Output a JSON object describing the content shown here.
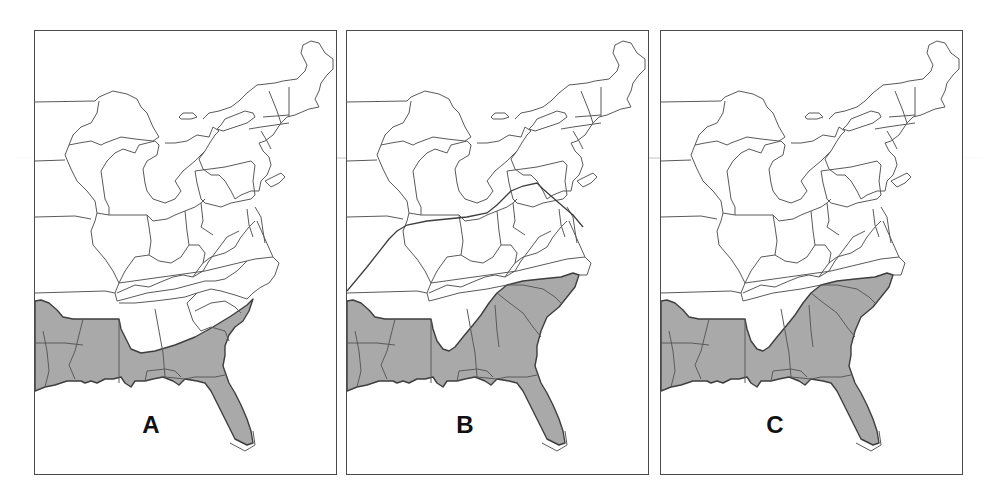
{
  "figure": {
    "shade_color": "#a9a9a9",
    "border_color": "#4a4a4a",
    "panels": [
      {
        "label": "A",
        "shaded_states": [
          "Texas (east part)",
          "Louisiana",
          "Arkansas (south)",
          "Mississippi",
          "Alabama (south)",
          "Georgia",
          "South Carolina",
          "Florida (except tip)"
        ],
        "has_outline_polygon": false
      },
      {
        "label": "B",
        "shaded_states": [
          "Texas (east part)",
          "Louisiana",
          "Arkansas (south)",
          "Mississippi",
          "Alabama (except wedge)",
          "Georgia",
          "South Carolina",
          "North Carolina (south)",
          "Florida (except tip)"
        ],
        "has_outline_polygon": true,
        "outline_polygon_note": "Outlined region covering Tennessee, Kentucky, and Virginia area"
      },
      {
        "label": "C",
        "shaded_states": [
          "Texas (east part)",
          "Louisiana",
          "Arkansas (south)",
          "Mississippi",
          "Alabama (except wedge)",
          "Georgia",
          "South Carolina",
          "North Carolina (south)",
          "Florida (except tip)"
        ],
        "has_outline_polygon": false
      }
    ]
  }
}
